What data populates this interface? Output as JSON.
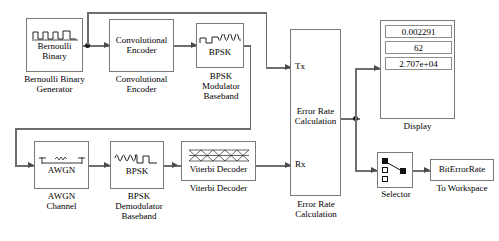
{
  "diagram": {
    "line_color": "#6e6e6e",
    "block_border_color": "#7a7a7a",
    "background": "#ffffff"
  },
  "blocks": {
    "bernoulli": {
      "label": "Bernoulli\nBinary",
      "caption": "Bernoulli Binary\nGenerator",
      "icon": "square-wave-icon"
    },
    "conv_encoder": {
      "label": "Convolutional\nEncoder",
      "caption": "Convolutional\nEncoder"
    },
    "bpsk_mod": {
      "label": "BPSK",
      "caption": "BPSK\nModulator\nBaseband",
      "icon": "square-to-sine-icon"
    },
    "awgn": {
      "label": "AWGN",
      "caption": "AWGN\nChannel",
      "icon": "awgn-noise-icon"
    },
    "bpsk_demod": {
      "label": "BPSK",
      "caption": "BPSK\nDemodulator\nBaseband",
      "icon": "sine-to-square-icon"
    },
    "viterbi": {
      "label": "Viterbi Decoder",
      "caption": "Viterbi Decoder",
      "icon": "trellis-icon"
    },
    "error_rate": {
      "label": "Error Rate\nCalculation",
      "caption": "Error Rate\nCalculation",
      "port_tx": "Tx",
      "port_rx": "Rx"
    },
    "display": {
      "caption": "Display",
      "values": [
        "0.002291",
        "62",
        "2.707e+04"
      ]
    },
    "selector": {
      "caption": "Selector",
      "icon": "selector-icon"
    },
    "to_workspace": {
      "label": "BitErrorRate",
      "caption": "To Workspace"
    }
  }
}
